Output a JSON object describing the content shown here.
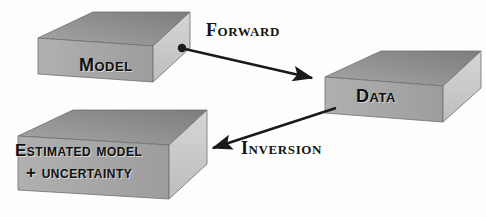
{
  "diagram": {
    "background_color": "#fdfdfd",
    "blocks": [
      {
        "id": "model",
        "label": "Model",
        "lines": [
          "Model"
        ],
        "top_face_color": "#8e8e8e",
        "front_face_color": "#c9c9c9",
        "side_face_color": "#a8a8a8",
        "edge_color": "#6f6f6f"
      },
      {
        "id": "data",
        "label": "Data",
        "lines": [
          "Data"
        ],
        "top_face_color": "#8e8e8e",
        "front_face_color": "#c9c9c9",
        "side_face_color": "#a8a8a8",
        "edge_color": "#6f6f6f"
      },
      {
        "id": "estimated-model",
        "label": "Estimated model + uncertainty",
        "lines": [
          "Estimated model",
          "+ uncertainty"
        ],
        "top_face_color": "#8e8e8e",
        "front_face_color": "#c9c9c9",
        "side_face_color": "#a8a8a8",
        "edge_color": "#6f6f6f"
      }
    ],
    "arrows": [
      {
        "id": "forward",
        "label": "Forward",
        "from": "model",
        "to": "data",
        "has_source_dot": true,
        "has_arrowhead": true,
        "color": "#1a1a1a"
      },
      {
        "id": "inversion",
        "label": "Inversion",
        "from": "data",
        "to": "estimated-model",
        "has_source_dot": false,
        "has_arrowhead": true,
        "color": "#1a1a1a"
      }
    ],
    "text_color": "#111111"
  }
}
